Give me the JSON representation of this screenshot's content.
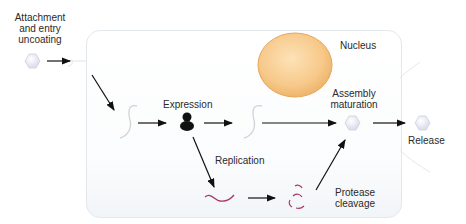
{
  "diagram": {
    "labels": {
      "attachment": "Attachment\nand entry\nuncoating",
      "attachment_l1": "Attachment",
      "attachment_l2": "and entry",
      "attachment_l3": "uncoating",
      "nucleus": "Nucleus",
      "expression": "Expression",
      "replication": "Replication",
      "assembly_l1": "Assembly",
      "assembly_l2": "maturation",
      "release": "Release",
      "protease_l1": "Protease",
      "protease_l2": "cleavage"
    },
    "nodes": [
      {
        "id": "virion-in",
        "shape": "hexagon",
        "label": "Attachment and entry uncoating"
      },
      {
        "id": "genome-in",
        "shape": "strand"
      },
      {
        "id": "ribosome",
        "shape": "ribosome",
        "label": "Expression"
      },
      {
        "id": "mrna",
        "shape": "strand"
      },
      {
        "id": "replicated-genome",
        "shape": "strand-red",
        "label": "Replication"
      },
      {
        "id": "cleaved-proteins",
        "shape": "fragments-red",
        "label": "Protease cleavage"
      },
      {
        "id": "assembled-virion",
        "shape": "hexagon",
        "label": "Assembly maturation"
      },
      {
        "id": "released-virion",
        "shape": "hexagon",
        "label": "Release"
      },
      {
        "id": "nucleus",
        "shape": "ellipse",
        "label": "Nucleus"
      }
    ],
    "edges": [
      {
        "from": "virion-in",
        "to": "genome-in"
      },
      {
        "from": "genome-in",
        "to": "ribosome"
      },
      {
        "from": "ribosome",
        "to": "mrna"
      },
      {
        "from": "mrna",
        "to": "assembled-virion"
      },
      {
        "from": "ribosome",
        "to": "replicated-genome"
      },
      {
        "from": "replicated-genome",
        "to": "cleaved-proteins"
      },
      {
        "from": "cleaved-proteins",
        "to": "assembled-virion"
      },
      {
        "from": "assembled-virion",
        "to": "released-virion"
      }
    ],
    "colors": {
      "nucleus_fill": "#f7c98a",
      "nucleus_edge": "#e6a75a",
      "virion_fill": "#e4e4f2",
      "strand_red": "#a8385a",
      "arrow": "#111111"
    }
  }
}
